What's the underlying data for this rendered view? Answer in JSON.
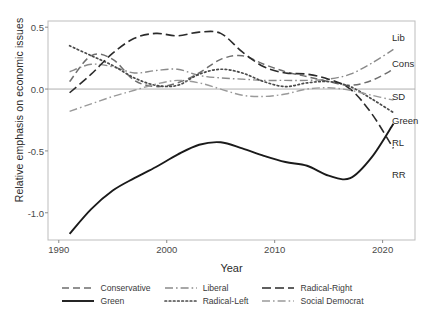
{
  "chart_data": {
    "type": "line",
    "title": "",
    "xlabel": "Year",
    "ylabel": "Relative emphasis on economic issues",
    "xlim": [
      1989.0,
      2023.0
    ],
    "ylim": [
      -1.22,
      0.55
    ],
    "xticks": [
      1990,
      2000,
      2010,
      2020
    ],
    "xtick_labels": [
      "1990",
      "2000",
      "2010",
      "2020"
    ],
    "yticks": [
      0.5,
      0.0,
      -0.5,
      -1.0
    ],
    "ytick_labels": [
      "0.5",
      "0.0",
      "-0.5",
      "-1.0"
    ],
    "grid": false,
    "zero_reference_line": 0.0,
    "legend_position": "bottom",
    "series": [
      {
        "name": "Conservative",
        "short_label": "Cons",
        "style": "dashed",
        "color": "#6e6e6e",
        "x": [
          1991,
          1993,
          1995,
          1997,
          1999,
          2001,
          2003,
          2005,
          2007,
          2009,
          2011,
          2013,
          2015,
          2017,
          2019,
          2021
        ],
        "y": [
          0.06,
          0.27,
          0.24,
          0.07,
          0.02,
          0.05,
          0.13,
          0.24,
          0.27,
          0.2,
          0.14,
          0.1,
          0.06,
          0.03,
          0.07,
          0.16
        ]
      },
      {
        "name": "Green",
        "short_label": "Green",
        "style": "solid",
        "color": "#1a1a1a",
        "x": [
          1991,
          1993,
          1995,
          1997,
          1999,
          2001,
          2003,
          2005,
          2007,
          2009,
          2011,
          2013,
          2015,
          2017,
          2019,
          2021
        ],
        "y": [
          -1.17,
          -0.97,
          -0.82,
          -0.72,
          -0.63,
          -0.53,
          -0.45,
          -0.43,
          -0.48,
          -0.54,
          -0.59,
          -0.62,
          -0.7,
          -0.72,
          -0.55,
          -0.28
        ]
      },
      {
        "name": "Liberal",
        "short_label": "Lib",
        "style": "dashdot",
        "color": "#8a8a8a",
        "x": [
          1991,
          1993,
          1995,
          1997,
          1999,
          2001,
          2003,
          2005,
          2007,
          2009,
          2011,
          2013,
          2015,
          2017,
          2019,
          2021
        ],
        "y": [
          0.14,
          0.2,
          0.18,
          0.13,
          0.15,
          0.16,
          0.11,
          0.09,
          0.08,
          0.07,
          0.07,
          0.07,
          0.08,
          0.12,
          0.21,
          0.32
        ]
      },
      {
        "name": "Radical-Left",
        "short_label": "RL",
        "style": "dotted",
        "color": "#4a4a4a",
        "x": [
          1991,
          1993,
          1995,
          1997,
          1999,
          2001,
          2003,
          2005,
          2007,
          2009,
          2011,
          2013,
          2015,
          2017,
          2019,
          2021
        ],
        "y": [
          0.35,
          0.27,
          0.19,
          0.09,
          0.03,
          0.03,
          0.12,
          0.16,
          0.13,
          0.06,
          0.02,
          0.05,
          0.06,
          0.02,
          -0.08,
          -0.19
        ]
      },
      {
        "name": "Radical-Right",
        "short_label": "RR",
        "style": "longdash",
        "color": "#2b2b2b",
        "x": [
          1991,
          1993,
          1995,
          1997,
          1999,
          2001,
          2003,
          2005,
          2007,
          2009,
          2011,
          2013,
          2015,
          2017,
          2019,
          2021
        ],
        "y": [
          -0.03,
          0.12,
          0.29,
          0.41,
          0.45,
          0.43,
          0.46,
          0.45,
          0.3,
          0.18,
          0.13,
          0.12,
          0.08,
          0.0,
          -0.2,
          -0.48
        ]
      },
      {
        "name": "Social Democrat",
        "short_label": "SD",
        "style": "dashdot-light",
        "color": "#9a9a9a",
        "x": [
          1991,
          1993,
          1995,
          1997,
          1999,
          2001,
          2003,
          2005,
          2007,
          2009,
          2011,
          2013,
          2015,
          2017,
          2019,
          2021
        ],
        "y": [
          -0.18,
          -0.12,
          -0.06,
          -0.01,
          0.04,
          0.07,
          0.05,
          0.0,
          -0.05,
          -0.06,
          -0.04,
          0.0,
          0.01,
          -0.01,
          -0.05,
          -0.09
        ]
      }
    ]
  },
  "axis": {
    "y_label": "Relative emphasis on economic issues",
    "x_label": "Year",
    "y_tick_0": "0.5",
    "y_tick_1": "0.0",
    "y_tick_2": "-0.5",
    "y_tick_3": "-1.0",
    "x_tick_0": "1990",
    "x_tick_1": "2000",
    "x_tick_2": "2010",
    "x_tick_3": "2020"
  },
  "legend": {
    "items": [
      {
        "label": "Conservative",
        "key": "conservative-key"
      },
      {
        "label": "Liberal",
        "key": "liberal-key"
      },
      {
        "label": "Radical-Right",
        "key": "radical-right-key"
      },
      {
        "label": "Green",
        "key": "green-key"
      },
      {
        "label": "Radical-Left",
        "key": "radical-left-key"
      },
      {
        "label": "Social Democrat",
        "key": "social-democrat-key"
      }
    ]
  },
  "series_labels": {
    "lib": "Lib",
    "cons": "Cons",
    "sd": "SD",
    "green": "Green",
    "rl": "RL",
    "rr": "RR"
  },
  "colors": {
    "panel_border": "#bdbdbd",
    "zero_line": "#b0b0b0",
    "text": "#2b2b2b",
    "tick_text": "#4a4a4a"
  }
}
